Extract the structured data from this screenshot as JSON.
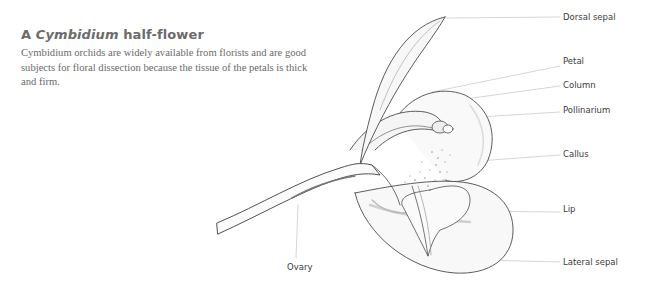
{
  "title": {
    "prefix": "A ",
    "italic": "Cymbidium",
    "suffix": " half-flower"
  },
  "description": "Cymbidium orchids are widely available from florists and are good subjects for floral dissection because the tissue of the petals is thick and firm.",
  "labels": [
    {
      "id": "dorsal-sepal",
      "text": "Dorsal sepal"
    },
    {
      "id": "petal",
      "text": "Petal"
    },
    {
      "id": "column",
      "text": "Column"
    },
    {
      "id": "pollinarium",
      "text": "Pollinarium"
    },
    {
      "id": "callus",
      "text": "Callus"
    },
    {
      "id": "lip",
      "text": "Lip"
    },
    {
      "id": "lateral-sepal",
      "text": "Lateral sepal"
    },
    {
      "id": "ovary",
      "text": "Ovary"
    }
  ],
  "colors": {
    "line": "#bdbdbd",
    "ink": "#4a4a4a",
    "label": "#3c3c3c"
  }
}
